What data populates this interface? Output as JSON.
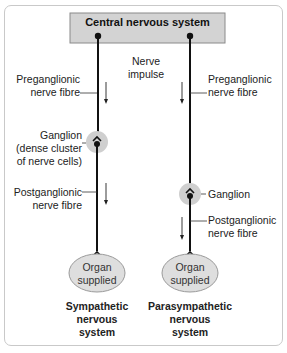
{
  "diagram": {
    "header": {
      "title": "Central nervous system"
    },
    "center_label": {
      "line1": "Nerve",
      "line2": "impulse"
    },
    "sympathetic": {
      "preganglionic": {
        "line1": "Preganglionic",
        "line2": "nerve fibre"
      },
      "ganglion": {
        "line1": "Ganglion",
        "line2": "(dense cluster",
        "line3": "of nerve cells)"
      },
      "postganglionic": {
        "line1": "Postganglionic",
        "line2": "nerve fibre"
      },
      "organ": {
        "line1": "Organ",
        "line2": "supplied"
      },
      "title": {
        "line1": "Sympathetic",
        "line2": "nervous",
        "line3": "system"
      }
    },
    "parasympathetic": {
      "preganglionic": {
        "line1": "Preganglionic",
        "line2": "nerve fibre"
      },
      "ganglion": {
        "line1": "Ganglion"
      },
      "postganglionic": {
        "line1": "Postganglionic",
        "line2": "nerve fibre"
      },
      "organ": {
        "line1": "Organ",
        "line2": "supplied"
      },
      "title": {
        "line1": "Parasympathetic",
        "line2": "nervous",
        "line3": "system"
      }
    },
    "colors": {
      "cns_box_fill": "#d3d3d3",
      "cns_box_border": "#8a8a8a",
      "ganglion_fill": "#cfcfcf",
      "organ_fill": "#dedede",
      "organ_border": "#9a9a9a",
      "nerve_line": "#111111",
      "frame_border": "#c9c9c9"
    }
  }
}
